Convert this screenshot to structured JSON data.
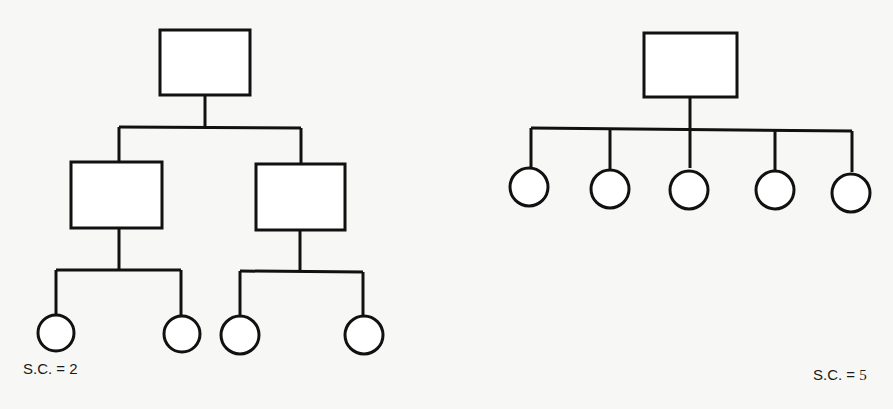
{
  "diagrams": [
    {
      "name": "tall-hierarchy",
      "span_of_control_label": "S.C. = 2",
      "levels": [
        {
          "level": 1,
          "shape": "rectangle",
          "count": 1
        },
        {
          "level": 2,
          "shape": "rectangle",
          "count": 2
        },
        {
          "level": 3,
          "shape": "circle",
          "count": 4
        }
      ]
    },
    {
      "name": "flat-hierarchy",
      "span_of_control_label_prefix": "S.C. =",
      "span_of_control_value": "5",
      "levels": [
        {
          "level": 1,
          "shape": "rectangle",
          "count": 1
        },
        {
          "level": 2,
          "shape": "circle",
          "count": 5
        }
      ]
    }
  ],
  "colors": {
    "stroke": "#111111",
    "background": "#f7f7f5",
    "fill": "#ffffff"
  }
}
